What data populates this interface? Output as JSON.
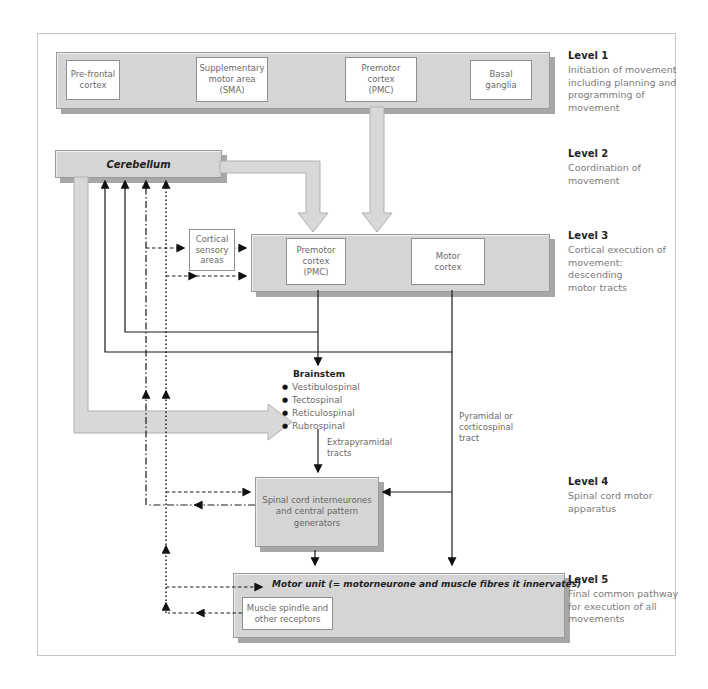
{
  "colors": {
    "bar_fill": "#d5d5d5",
    "bar_border": "#9a9a9a",
    "shadow": "#a7a7a7",
    "box_border": "#8f8f8f",
    "band_fill": "#d8d8d8",
    "band_edge": "#b1b1b1",
    "text_muted": "#6b6b6b",
    "text_dark": "#1f1f1f",
    "frame_border": "#c6c6c6"
  },
  "level1": {
    "boxes": {
      "prefrontal": "Pre-frontal\ncortex",
      "sma": "Supplementary\nmotor area\n(SMA)",
      "premotor": "Premotor\ncortex\n(PMC)",
      "basal": "Basal\nganglia"
    }
  },
  "level2": {
    "cerebellum": "Cerebellum"
  },
  "level3": {
    "cortical_sensory": "Cortical\nsensory\nareas",
    "premotor": "Premotor\ncortex\n(PMC)",
    "motor": "Motor\ncortex"
  },
  "brainstem": {
    "title": "Brainstem",
    "bullet": "●",
    "tracts": [
      "Vestibulospinal",
      "Tectospinal",
      "Reticulospinal",
      "Rubrospinal"
    ],
    "extrapyramidal_label": "Extrapyramidal\ntracts",
    "pyramidal_label": "Pyramidal or\ncorticospinal\ntract"
  },
  "level4": {
    "spinal": "Spinal cord interneurones\nand central pattern\ngenerators"
  },
  "level5": {
    "motor_unit": "Motor unit (= motorneurone and muscle fibres it innervates)",
    "muscle_spindle": "Muscle spindle and\nother receptors"
  },
  "annotations": [
    {
      "heading": "Level 1",
      "text": "Initiation of movement\nincluding planning and\nprogramming of\nmovement"
    },
    {
      "heading": "Level 2",
      "text": "Coordination of\nmovement"
    },
    {
      "heading": "Level 3",
      "text": "Cortical execution of\nmovement: descending\nmotor tracts"
    },
    {
      "heading": "Level 4",
      "text": "Spinal cord motor\napparatus"
    },
    {
      "heading": "Level 5",
      "text": "Final common pathway\nfor execution of all\nmovements"
    }
  ]
}
